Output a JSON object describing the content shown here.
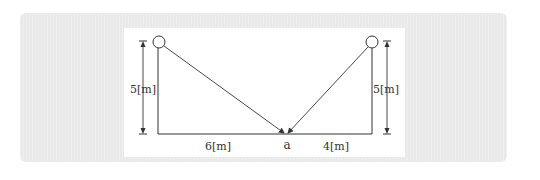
{
  "diagram": {
    "labels": {
      "left_height": "5[m]",
      "right_height": "5[m]",
      "left_distance": "6[m]",
      "right_distance": "4[m]",
      "point": "a"
    },
    "colors": {
      "background": "#e9e9e9",
      "panel": "#ffffff",
      "lines": "#333333"
    }
  }
}
